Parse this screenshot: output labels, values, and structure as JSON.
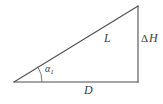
{
  "figure": {
    "type": "right-triangle-diagram",
    "background_color": "#ffffff",
    "line_color": "#4d4d4d",
    "label_color": "#3d3d3d",
    "labels": {
      "hypotenuse": "L",
      "vertical_leg_delta": "Δ",
      "vertical_leg_symbol": "H",
      "vertical_leg_full": "ΔH",
      "horizontal_leg": "D",
      "angle_symbol": "α",
      "angle_subscript": "1",
      "angle_full": "α₁"
    },
    "geometry": {
      "left_vertex": [
        14,
        82
      ],
      "top_right_vertex": [
        138,
        6
      ],
      "bottom_right_vertex": [
        138,
        82
      ],
      "angle_arc_radius": 28
    }
  }
}
